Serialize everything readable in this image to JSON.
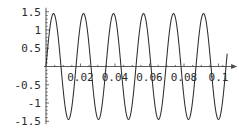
{
  "chart_data": {
    "type": "line",
    "title": "",
    "subtitle": "",
    "xlabel": "",
    "ylabel": "",
    "grid": false,
    "legend": false,
    "legend_position": "none",
    "xlim": [
      0.0,
      0.105
    ],
    "ylim": [
      -1.5,
      1.5
    ],
    "x_ticks": [
      0.02,
      0.04,
      0.06,
      0.08,
      0.1
    ],
    "x_tick_labels": [
      "0.02",
      "0.04",
      "0.06",
      "0.08",
      "0.1"
    ],
    "x_minor_ticks": [
      0.005,
      0.01,
      0.015,
      0.025,
      0.03,
      0.035,
      0.045,
      0.05,
      0.055,
      0.065,
      0.07,
      0.075,
      0.085,
      0.09,
      0.095,
      0.1025
    ],
    "y_ticks": [
      -1.5,
      -1,
      -0.5,
      0.5,
      1,
      1.5
    ],
    "y_tick_labels": [
      "-1.5",
      "-1",
      "-0.5",
      "0.5",
      "1",
      "1.5"
    ],
    "y_minor_ticks": [
      -1.4,
      -1.3,
      -1.2,
      -1.1,
      -0.9,
      -0.8,
      -0.7,
      -0.6,
      -0.4,
      -0.3,
      -0.2,
      -0.1,
      0.1,
      0.2,
      0.3,
      0.4,
      0.6,
      0.7,
      0.8,
      0.9,
      1.1,
      1.2,
      1.3,
      1.4
    ],
    "axis_origin": [
      0.0,
      0.0
    ],
    "axis_arrows": true,
    "series": [
      {
        "name": "sine",
        "color": "#2e2e2e",
        "amplitude": 1.45,
        "frequency_hz": 57.5,
        "phase": 0.0,
        "offset": 0.0,
        "x_start": 0.0,
        "x_end": 0.105,
        "peaks_x": [
          0.00435,
          0.02174,
          0.03913,
          0.05652,
          0.07391,
          0.0913
        ],
        "troughs_x": [
          0.01304,
          0.03043,
          0.04783,
          0.06522,
          0.08261,
          0.1
        ],
        "zero_crossings_x": [
          0.0,
          0.0087,
          0.01739,
          0.02609,
          0.03478,
          0.04348,
          0.05217,
          0.06087,
          0.06957,
          0.07826,
          0.08696,
          0.09565,
          0.10435
        ],
        "values_note": "y = 1.45 * sin(2*pi*57.5*x)"
      }
    ],
    "colors": {
      "background": "#ffffff",
      "curve": "#2e2e2e",
      "axis": "#4a4a4a",
      "tick_label": "#2b2b2b"
    }
  }
}
